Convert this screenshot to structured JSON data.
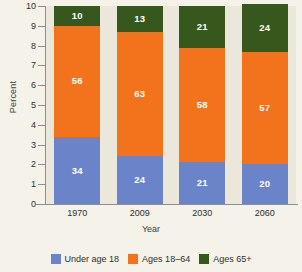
{
  "chart_data": {
    "type": "bar",
    "stacked": true,
    "title": "",
    "xlabel": "Year",
    "ylabel": "Percent",
    "categories": [
      "1970",
      "2009",
      "2030",
      "2060"
    ],
    "ylim": [
      0,
      10
    ],
    "yticks": [
      "0",
      "1",
      "2",
      "3",
      "4",
      "5",
      "6",
      "7",
      "8",
      "9",
      "10"
    ],
    "grid": false,
    "legend_position": "bottom",
    "series": [
      {
        "name": "Under age 18",
        "color": "#6b84c9",
        "values": [
          34,
          24,
          21,
          20
        ]
      },
      {
        "name": "Ages 18–64",
        "color": "#f2731c",
        "values": [
          56,
          63,
          58,
          57
        ]
      },
      {
        "name": "Ages 65+",
        "color": "#37581c",
        "values": [
          10,
          13,
          21,
          24
        ]
      }
    ]
  },
  "colors": {
    "plot_background": "#ece7db",
    "page_background": "#f5f2ea",
    "axis": "#8e8e8e",
    "value_label": "#ffffff"
  }
}
